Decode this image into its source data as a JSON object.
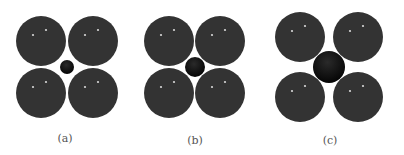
{
  "figure": {
    "colors": {
      "large_sphere": "#333333",
      "small_sphere": "#111111",
      "highlight": "#d8d8d8",
      "background": "#ffffff",
      "label": "#555555"
    },
    "panels": [
      {
        "label": "(a)",
        "label_pos": [
          65,
          138
        ],
        "large_radius": 25,
        "large_centers": [
          [
            41,
            41
          ],
          [
            93,
            41
          ],
          [
            41,
            93
          ],
          [
            93,
            93
          ]
        ],
        "small_center": [
          67,
          67
        ],
        "small_radius": 7
      },
      {
        "label": "(b)",
        "label_pos": [
          195,
          140
        ],
        "large_radius": 25,
        "large_centers": [
          [
            169,
            41
          ],
          [
            220,
            41
          ],
          [
            169,
            93
          ],
          [
            220,
            93
          ]
        ],
        "small_center": [
          195,
          67
        ],
        "small_radius": 10
      },
      {
        "label": "(c)",
        "label_pos": [
          330,
          140
        ],
        "large_radius": 25,
        "large_centers": [
          [
            300,
            37
          ],
          [
            358,
            37
          ],
          [
            300,
            97
          ],
          [
            358,
            97
          ]
        ],
        "small_center": [
          329,
          67
        ],
        "small_radius": 16
      }
    ]
  }
}
